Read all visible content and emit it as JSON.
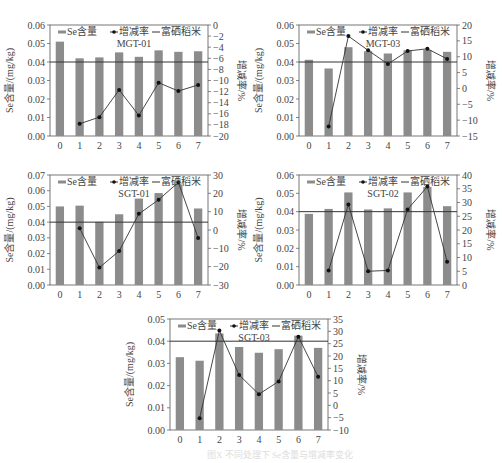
{
  "chart_data": [
    {
      "type": "bar+line",
      "title": "MGT-01",
      "categories": [
        "0",
        "1",
        "2",
        "3",
        "4",
        "5",
        "6",
        "7"
      ],
      "legend": [
        "Se含量",
        "增减率",
        "富硒稻米"
      ],
      "ylabel": "Se含量/(mg/kg)",
      "y2label": "增减率/%",
      "ylim": [
        0,
        0.06
      ],
      "yticks": [
        "0.00",
        "0.01",
        "0.02",
        "0.03",
        "0.04",
        "0.05",
        "0.06"
      ],
      "y2lim": [
        -20,
        0
      ],
      "y2ticks": [
        "-20",
        "-18",
        "-16",
        "-14",
        "-12",
        "-10",
        "-8",
        "-6",
        "-4",
        "-2",
        "0"
      ],
      "threshold": 0.04,
      "series": [
        {
          "name": "Se含量",
          "type": "bar",
          "values": [
            0.051,
            0.042,
            0.0425,
            0.0452,
            0.0428,
            0.0463,
            0.0455,
            0.0458
          ]
        },
        {
          "name": "增减率",
          "type": "line",
          "axis": "right",
          "values": [
            null,
            -17.8,
            -16.6,
            -11.7,
            -16.3,
            -10.4,
            -11.9,
            -10.8
          ]
        }
      ]
    },
    {
      "type": "bar+line",
      "title": "MGT-03",
      "categories": [
        "0",
        "1",
        "2",
        "3",
        "4",
        "5",
        "6",
        "7"
      ],
      "legend": [
        "Se含量",
        "增减率",
        "富硒稻米"
      ],
      "ylabel": "Se含量/(mg/kg)",
      "y2label": "增减率/%",
      "ylim": [
        0,
        0.06
      ],
      "yticks": [
        "0.00",
        "0.01",
        "0.02",
        "0.03",
        "0.04",
        "0.05",
        "0.06"
      ],
      "y2lim": [
        -15,
        20
      ],
      "y2ticks": [
        "-15",
        "-10",
        "-5",
        "0",
        "5",
        "10",
        "15",
        "20"
      ],
      "threshold": 0.04,
      "series": [
        {
          "name": "Se含量",
          "type": "bar",
          "values": [
            0.0412,
            0.0365,
            0.048,
            0.0458,
            0.0446,
            0.0463,
            0.0465,
            0.0455
          ]
        },
        {
          "name": "增减率",
          "type": "line",
          "axis": "right",
          "values": [
            null,
            -12,
            16.5,
            12,
            7.7,
            11.8,
            12.5,
            9.3
          ]
        }
      ]
    },
    {
      "type": "bar+line",
      "title": "SGT-01",
      "categories": [
        "0",
        "1",
        "2",
        "3",
        "4",
        "5",
        "6",
        "7"
      ],
      "legend": [
        "Se含量",
        "增减率",
        "富硒稻米"
      ],
      "ylabel": "Se含量/(mg/kg)",
      "y2label": "增减率/%",
      "ylim": [
        0,
        0.07
      ],
      "yticks": [
        "0.00",
        "0.01",
        "0.02",
        "0.03",
        "0.04",
        "0.05",
        "0.06",
        "0.07"
      ],
      "y2lim": [
        -30,
        30
      ],
      "y2ticks": [
        "-30",
        "-20",
        "-10",
        "0",
        "10",
        "20",
        "30"
      ],
      "threshold": 0.04,
      "series": [
        {
          "name": "Se含量",
          "type": "bar",
          "values": [
            0.05,
            0.0505,
            0.0402,
            0.045,
            0.055,
            0.0585,
            0.064,
            0.0487
          ]
        },
        {
          "name": "增减率",
          "type": "line",
          "axis": "right",
          "values": [
            null,
            1,
            -20.5,
            -11.5,
            8.8,
            16.5,
            26,
            -4.3
          ]
        }
      ]
    },
    {
      "type": "bar+line",
      "title": "SGT-02",
      "categories": [
        "0",
        "1",
        "2",
        "3",
        "4",
        "5",
        "6",
        "7"
      ],
      "legend": [
        "Se含量",
        "增减率",
        "富硒稻米"
      ],
      "ylabel": "Se含量/(mg/kg)",
      "y2label": "增减率/%",
      "ylim": [
        0,
        0.06
      ],
      "yticks": [
        "0.00",
        "0.01",
        "0.02",
        "0.03",
        "0.04",
        "0.05",
        "0.06"
      ],
      "y2lim": [
        0,
        40
      ],
      "y2ticks": [
        "0",
        "5",
        "10",
        "15",
        "20",
        "25",
        "30",
        "35",
        "40"
      ],
      "threshold": 0.04,
      "series": [
        {
          "name": "Se含量",
          "type": "bar",
          "values": [
            0.0388,
            0.0415,
            0.0505,
            0.0412,
            0.0418,
            0.0505,
            0.0535,
            0.043
          ]
        },
        {
          "name": "增减率",
          "type": "line",
          "axis": "right",
          "values": [
            null,
            5.3,
            29.3,
            5,
            5.3,
            27.5,
            35.8,
            8.5
          ]
        }
      ]
    },
    {
      "type": "bar+line",
      "title": "SGT-03",
      "categories": [
        "0",
        "1",
        "2",
        "3",
        "4",
        "5",
        "6",
        "7"
      ],
      "legend": [
        "Se含量",
        "增减率",
        "富硒稻米"
      ],
      "ylabel": "Se含量/(mg/kg)",
      "y2label": "增减率/%",
      "ylim": [
        0,
        0.05
      ],
      "yticks": [
        "0.00",
        "0.01",
        "0.02",
        "0.03",
        "0.04",
        "0.05"
      ],
      "y2lim": [
        -10,
        35
      ],
      "y2ticks": [
        "-10",
        "-5",
        "0",
        "5",
        "10",
        "15",
        "20",
        "25",
        "30",
        "35"
      ],
      "threshold": 0.04,
      "series": [
        {
          "name": "Se含量",
          "type": "bar",
          "values": [
            0.0328,
            0.0312,
            0.0435,
            0.0374,
            0.0348,
            0.0364,
            0.0425,
            0.037
          ]
        },
        {
          "name": "增减率",
          "type": "line",
          "axis": "right",
          "values": [
            null,
            -5.2,
            30.3,
            12.3,
            4.5,
            9.7,
            27.8,
            11.6
          ]
        }
      ]
    }
  ],
  "layout": {
    "panels": [
      {
        "x": 0,
        "y": 0,
        "w": 250,
        "h": 155,
        "plot": {
          "x": 50,
          "y": 25,
          "w": 158,
          "h": 111
        }
      },
      {
        "x": 250,
        "y": 0,
        "w": 252,
        "h": 155,
        "plot": {
          "x": 299,
          "y": 25,
          "w": 158,
          "h": 111
        }
      },
      {
        "x": 0,
        "y": 150,
        "w": 250,
        "h": 150,
        "plot": {
          "x": 50,
          "y": 175,
          "w": 158,
          "h": 110
        }
      },
      {
        "x": 250,
        "y": 150,
        "w": 252,
        "h": 150,
        "plot": {
          "x": 299,
          "y": 175,
          "w": 158,
          "h": 110
        }
      },
      {
        "x": 120,
        "y": 300,
        "w": 260,
        "h": 150,
        "plot": {
          "x": 170,
          "y": 319,
          "w": 158,
          "h": 111
        }
      }
    ],
    "colors": {
      "bar": "#8c8c8c",
      "line": "#333333",
      "threshold": "#333333",
      "axis": "#555555"
    }
  },
  "caption": "图X 不同处理下 Se含量与增减率变化"
}
